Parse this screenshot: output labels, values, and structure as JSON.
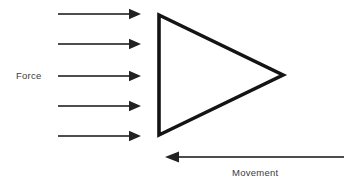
{
  "canvas": {
    "width": 348,
    "height": 185,
    "background_color": "#ffffff"
  },
  "diagram": {
    "ink_color": "#111111",
    "label_color": "#3b3b3b"
  },
  "labels": {
    "force": "Force",
    "movement": "Movement"
  },
  "force_arrows": {
    "name": "force-arrows",
    "count": 5,
    "direction": "right",
    "color": "#222222",
    "shaft_width": 1.6,
    "x_start": 58,
    "x_tip": 141,
    "head_length": 12,
    "head_half_height": 5.2,
    "y_positions": [
      14,
      44,
      76,
      106,
      136
    ]
  },
  "movement_arrow": {
    "name": "movement-arrow",
    "direction": "left",
    "color": "#222222",
    "shaft_width": 1.6,
    "x_start": 343,
    "x_tip": 165,
    "head_length": 14,
    "head_half_height": 5.6,
    "y": 157
  },
  "triangle": {
    "name": "triangle-shape",
    "points": "159,15 159,135 283,75",
    "stroke_color": "#141414",
    "stroke_width": 3.6,
    "fill": "none",
    "vertices": {
      "top_left": [
        159,
        15
      ],
      "bottom_left": [
        159,
        135
      ],
      "right_tip": [
        283,
        75
      ]
    }
  },
  "label_positions": {
    "force": {
      "x": 16,
      "y": 79
    },
    "movement": {
      "x": 232,
      "y": 176
    }
  }
}
